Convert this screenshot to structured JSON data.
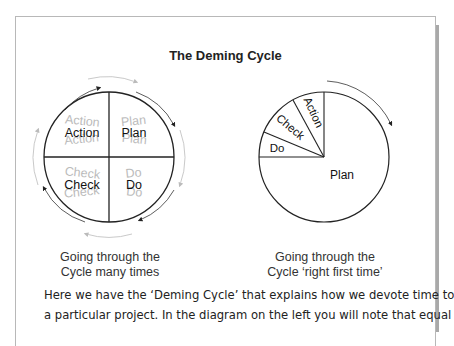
{
  "title": "The Deming Cycle",
  "left_diagram": {
    "quadrants": {
      "top_left": "Action",
      "top_right": "Plan",
      "bottom_left": "Check",
      "bottom_right": "Do"
    },
    "caption_line1": "Going through the",
    "caption_line2": "Cycle many times"
  },
  "right_diagram": {
    "slices": {
      "do": "Do",
      "check": "Check",
      "action": "Action",
      "plan": "Plan"
    },
    "caption_line1": "Going through the",
    "caption_line2": "Cycle ‘right first time’"
  },
  "paragraph": {
    "line1": "Here we have the ‘Deming Cycle’ that explains how we devote time to",
    "line2": "a particular project. In the diagram on the left you will note that equal"
  }
}
